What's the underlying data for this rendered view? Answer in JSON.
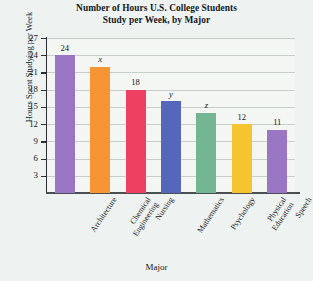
{
  "chart_data": {
    "type": "bar",
    "title": "Number of Hours U.S. College Students Study per Week, by Major",
    "title_lines": [
      "Number of Hours U.S. College Students",
      "Study per Week, by Major"
    ],
    "xlabel": "Major",
    "ylabel": "Hours Spent Studying per Week",
    "ylim": [
      0,
      27
    ],
    "yticks": [
      3,
      6,
      9,
      12,
      15,
      18,
      21,
      24,
      27
    ],
    "ytick_labels": [
      "3",
      "6",
      "9",
      "12",
      "15",
      "18",
      "21",
      "24",
      "27"
    ],
    "grid": true,
    "legend": false,
    "categories": [
      "Architecture",
      "Chemical Engineering",
      "Nursing",
      "Mathematics",
      "Psychology",
      "Physical Education",
      "Speech"
    ],
    "category_lines": [
      [
        "Architecture"
      ],
      [
        "Chemical",
        "Engineering"
      ],
      [
        "Nursing"
      ],
      [
        "Mathematics"
      ],
      [
        "Psychology"
      ],
      [
        "Physical",
        "Education"
      ],
      [
        "Speech"
      ]
    ],
    "values": [
      24,
      22,
      18,
      16,
      14,
      12,
      11
    ],
    "data_labels": [
      "24",
      "x",
      "18",
      "y",
      "z",
      "12",
      "11"
    ],
    "data_label_is_variable": [
      false,
      true,
      false,
      true,
      true,
      false,
      false
    ],
    "colors": [
      "#9b76c4",
      "#f79434",
      "#ee4060",
      "#5566bb",
      "#74b691",
      "#f5c431",
      "#9b76c4"
    ],
    "plot_background": "#f3f6f3",
    "gridline_color": "#c8cec9",
    "axis_color": "#2b2f33",
    "figure_background": "#eef2f0"
  }
}
